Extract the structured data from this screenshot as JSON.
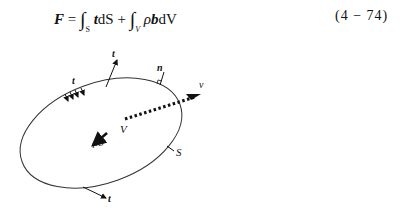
{
  "equation": {
    "lhs": "F",
    "equals": "=",
    "integral_symbol": "∫",
    "term1_sub": "S",
    "term1_integrand": "t",
    "term1_diff": "dS",
    "plus": "+",
    "term2_sub": "V",
    "term2_rho": "ρ",
    "term2_integrand": "b",
    "term2_diff": "dV",
    "number": "(4 − 74)"
  },
  "figure": {
    "labels": {
      "traction_left": "t",
      "traction_top": "t",
      "normal": "n",
      "velocity": "v",
      "volume": "V",
      "body_force": "ρb",
      "surface": "S",
      "traction_bottom": "t"
    }
  }
}
